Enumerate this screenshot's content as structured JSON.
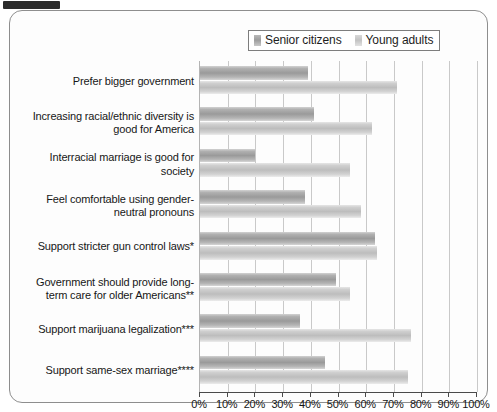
{
  "chart_data": {
    "type": "bar",
    "orientation": "horizontal",
    "title": "",
    "xlabel": "",
    "ylabel": "",
    "xlim": [
      0,
      100
    ],
    "xtick_labels": [
      "0%",
      "10%",
      "20%",
      "30%",
      "40%",
      "50%",
      "60%",
      "70%",
      "80%",
      "90%",
      "100%"
    ],
    "xtick_values": [
      0,
      10,
      20,
      30,
      40,
      50,
      60,
      70,
      80,
      90,
      100
    ],
    "grid": true,
    "legend_position": "top-right",
    "categories": [
      "Prefer bigger government",
      "Increasing racial/ethnic diversity is good for America",
      "Interracial marriage is good for society",
      "Feel comfortable using gender-neutral pronouns",
      "Support stricter gun control laws*",
      "Government should provide long-term care for older Americans**",
      "Support marijuana legalization***",
      "Support same-sex marriage****"
    ],
    "series": [
      {
        "name": "Senior citizens",
        "color": "#9a9a9a",
        "values": [
          39,
          41,
          20,
          38,
          63,
          49,
          36,
          45
        ]
      },
      {
        "name": "Young adults",
        "color": "#c6c6c6",
        "values": [
          71,
          62,
          54,
          58,
          64,
          54,
          76,
          75
        ]
      }
    ]
  },
  "legend": {
    "entries": [
      {
        "label": "Senior citizens"
      },
      {
        "label": "Young adults"
      }
    ]
  }
}
